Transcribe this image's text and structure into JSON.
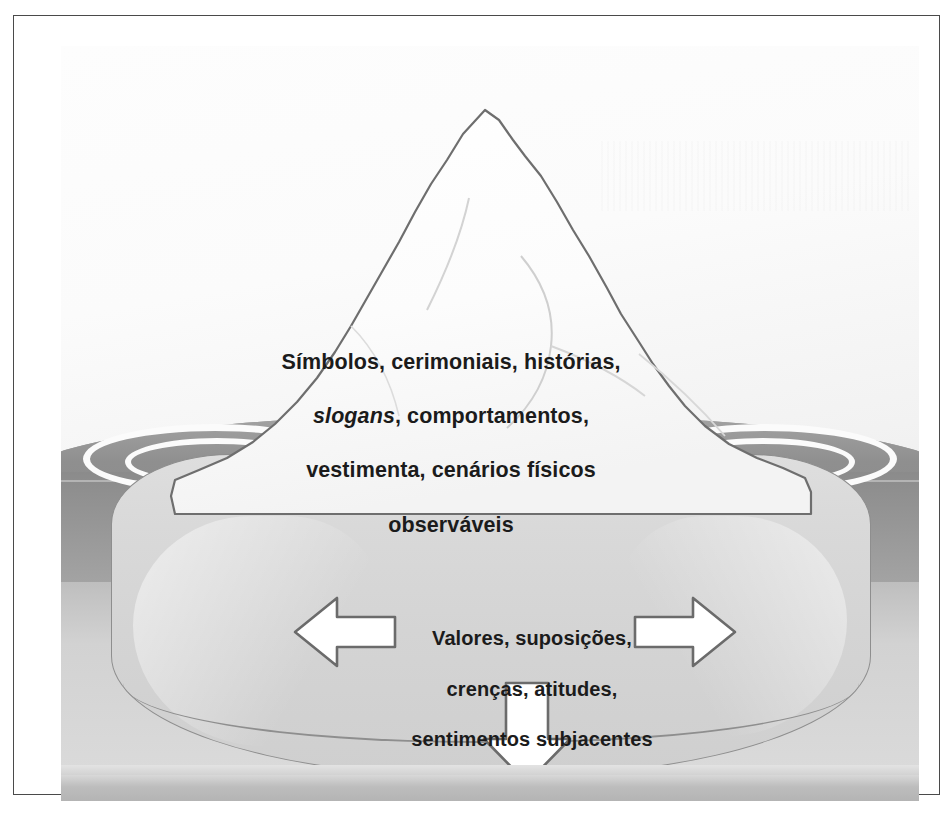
{
  "figure": {
    "type": "iceberg-diagram",
    "language": "pt-BR",
    "colors": {
      "page_background": "#ffffff",
      "frame_border": "#4a4a4a",
      "plate_background": "#f4f4f4",
      "water_surface": "#9b9b9b",
      "water_deep": "#8b8b8b",
      "iceberg_above": "#ffffff",
      "iceberg_below": "#d6d6d6",
      "iceberg_outline": "#6e6e6e",
      "arrow_fill": "#ffffff",
      "arrow_outline": "#6b6b6b",
      "text": "#1b1b1b",
      "ripple": "#fbfbfb"
    },
    "above_water": {
      "label": "Símbolos, cerimoniais, histórias,\nslogans, comportamentos,\nvestimenta, cenários físicos\nobserváveis",
      "lines": [
        "Símbolos, cerimoniais, histórias,",
        "slogans, comportamentos,",
        "vestimenta, cenários físicos",
        "observáveis"
      ],
      "italic_words": [
        "slogans"
      ]
    },
    "below_water": {
      "label": "Valores, suposições,\ncrenças, atitudes,\nsentimentos subjacentes",
      "lines": [
        "Valores, suposições,",
        "crenças, atitudes,",
        "sentimentos subjacentes"
      ],
      "italic_words": []
    },
    "arrows": [
      {
        "name": "arrow-left",
        "direction": "left"
      },
      {
        "name": "arrow-right",
        "direction": "right"
      },
      {
        "name": "arrow-down",
        "direction": "down"
      }
    ],
    "ripples": [
      {
        "name": "ripple-left-outer"
      },
      {
        "name": "ripple-left-inner"
      },
      {
        "name": "ripple-right-outer"
      },
      {
        "name": "ripple-right-inner"
      }
    ]
  }
}
